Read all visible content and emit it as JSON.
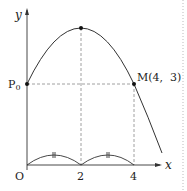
{
  "diagram": {
    "type": "parabola-graph",
    "axes": {
      "x_label": "x",
      "y_label": "y",
      "origin_label": "O"
    },
    "x_ticks": [
      "2",
      "4"
    ],
    "points": {
      "p0": {
        "label": "P",
        "subscript": "0"
      },
      "m": {
        "label": "M(4,  3)"
      },
      "vertex": {
        "label": ""
      }
    },
    "equal_marks": "||",
    "colors": {
      "stroke": "#333333",
      "dash": "#888888",
      "margin": "#bbbbbb"
    }
  }
}
